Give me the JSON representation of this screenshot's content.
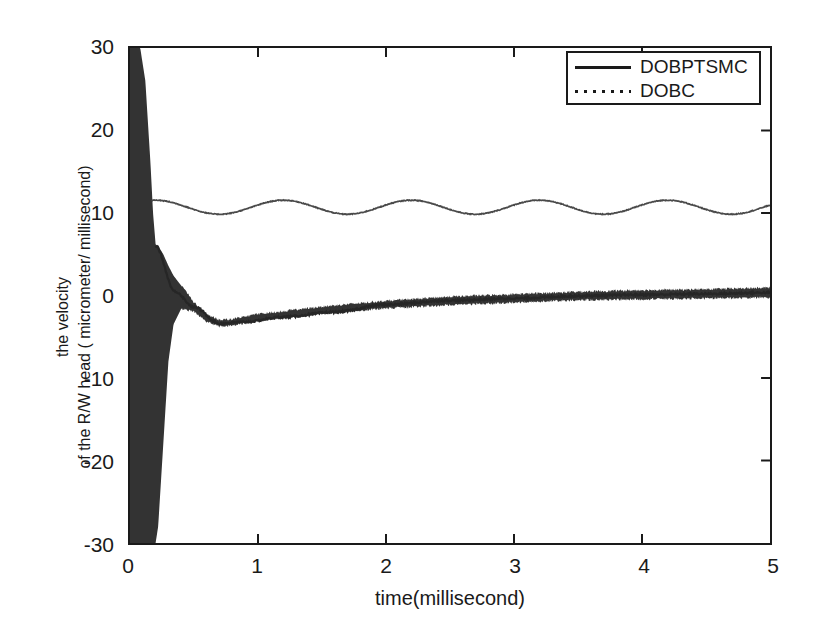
{
  "figure": {
    "background_color": "#ffffff",
    "axis_color": "#1a1a1a"
  },
  "axes": {
    "x_title": "time(millisecond)",
    "y_title_line1": "the velocity",
    "y_title_line2": "of the R/W head ( micrometer/ millisecond)",
    "x_ticks": [
      "0",
      "1",
      "2",
      "3",
      "4",
      "5"
    ],
    "y_ticks": [
      "30",
      "20",
      "10",
      "0",
      "-10",
      "-20",
      "-30"
    ]
  },
  "legend": {
    "position": "upper-right",
    "entries": [
      {
        "label": "DOBPTSMC",
        "style": "solid",
        "color": "#1a1a1a"
      },
      {
        "label": "DOBC",
        "style": "dotted",
        "color": "#1a1a1a"
      }
    ]
  },
  "bleed": {
    "text": ""
  },
  "chart_data": {
    "type": "line",
    "title": "",
    "subtitle": "",
    "xlabel": "time(millisecond)",
    "ylabel": "the velocity of the R/W head ( micrometer/ millisecond)",
    "xlim": [
      0,
      5
    ],
    "ylim": [
      -30,
      30
    ],
    "xticks": [
      0,
      1,
      2,
      3,
      4,
      5
    ],
    "yticks": [
      -30,
      -20,
      -10,
      0,
      10,
      20,
      30
    ],
    "grid": false,
    "legend_position": "upper right",
    "annotations": [],
    "series": [
      {
        "name": "DOBPTSMC",
        "style": "solid",
        "color": "#1a1a1a",
        "description": "High-frequency chattering band: saturates the full +30/-30 range for t<0.15 ms, envelope collapses rapidly, overshoots to about +6 near t=0.2, undershoots to about -3.4 near t=0.7, then slowly converges to 0 with a thin noisy band of roughly +/-0.6 amplitude.",
        "chatter_envelope": [
          {
            "x": 0.0,
            "upper": 30,
            "lower": -30
          },
          {
            "x": 0.04,
            "upper": 30,
            "lower": -30
          },
          {
            "x": 0.08,
            "upper": 30,
            "lower": -30
          },
          {
            "x": 0.12,
            "upper": 26,
            "lower": -30
          },
          {
            "x": 0.16,
            "upper": 16,
            "lower": -30
          },
          {
            "x": 0.18,
            "upper": 10,
            "lower": -30
          },
          {
            "x": 0.2,
            "upper": 6.2,
            "lower": -30
          },
          {
            "x": 0.22,
            "upper": 6.0,
            "lower": -28
          },
          {
            "x": 0.26,
            "upper": 5.0,
            "lower": -18
          },
          {
            "x": 0.3,
            "upper": 3.6,
            "lower": -8
          },
          {
            "x": 0.34,
            "upper": 2.4,
            "lower": -3.5
          },
          {
            "x": 0.4,
            "upper": 1.2,
            "lower": -1.6
          },
          {
            "x": 0.5,
            "upper": -0.9,
            "lower": -1.9
          },
          {
            "x": 0.6,
            "upper": -2.4,
            "lower": -3.1
          },
          {
            "x": 0.7,
            "upper": -3.0,
            "lower": -3.7
          },
          {
            "x": 0.8,
            "upper": -2.9,
            "lower": -3.6
          },
          {
            "x": 1.0,
            "upper": -2.3,
            "lower": -3.0
          },
          {
            "x": 1.5,
            "upper": -1.4,
            "lower": -2.2
          },
          {
            "x": 2.0,
            "upper": -0.7,
            "lower": -1.5
          },
          {
            "x": 2.5,
            "upper": -0.2,
            "lower": -1.1
          },
          {
            "x": 3.0,
            "upper": 0.1,
            "lower": -0.8
          },
          {
            "x": 3.5,
            "upper": 0.4,
            "lower": -0.5
          },
          {
            "x": 4.0,
            "upper": 0.6,
            "lower": -0.4
          },
          {
            "x": 4.5,
            "upper": 0.7,
            "lower": -0.3
          },
          {
            "x": 5.0,
            "upper": 0.9,
            "lower": -0.2
          }
        ],
        "x": [
          0.0,
          0.2,
          0.35,
          0.5,
          0.7,
          0.9,
          1.2,
          1.6,
          2.0,
          2.5,
          3.0,
          3.5,
          4.0,
          4.5,
          5.0
        ],
        "y": [
          0.0,
          6.0,
          0.5,
          -1.4,
          -3.4,
          -3.2,
          -2.6,
          -2.0,
          -1.1,
          -0.6,
          -0.35,
          -0.05,
          0.1,
          0.2,
          0.35
        ]
      },
      {
        "name": "DOBC",
        "style": "dotted",
        "color": "#3a3a3a",
        "description": "Smooth sinusoidal steady-state oscillation of roughly 1 ms period, centred near 10.7 with amplitude about 0.8, beginning at about 11.3 at t=0.17 after the initial transient.",
        "oscillation": {
          "mean": 10.7,
          "amplitude": 0.85,
          "period_ms": 1.0,
          "phase_deg": 80
        },
        "x": [
          0.17,
          0.3,
          0.45,
          0.6,
          0.75,
          0.9,
          1.05,
          1.2,
          1.35,
          1.5,
          1.7,
          1.9,
          2.1,
          2.3,
          2.5,
          2.7,
          2.9,
          3.1,
          3.3,
          3.5,
          3.7,
          3.9,
          4.1,
          4.3,
          4.5,
          4.7,
          4.9,
          5.0
        ],
        "y": [
          11.3,
          11.4,
          11.0,
          10.3,
          9.9,
          10.1,
          10.8,
          11.4,
          11.5,
          11.1,
          10.2,
          9.9,
          10.6,
          11.4,
          11.5,
          10.8,
          10.0,
          9.9,
          10.6,
          11.3,
          11.5,
          10.9,
          10.1,
          9.9,
          10.5,
          11.3,
          11.4,
          11.0
        ]
      }
    ]
  }
}
